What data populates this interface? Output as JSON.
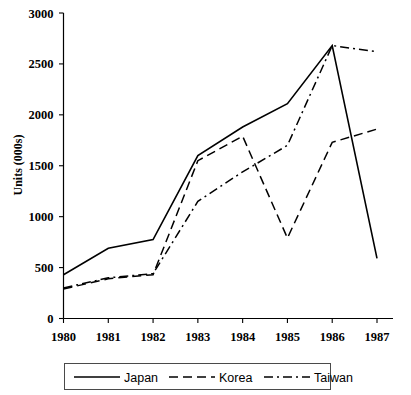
{
  "chart_data": {
    "type": "line",
    "title": "",
    "subtitle": "",
    "xlabel": "",
    "ylabel": "Units (000s)",
    "categories": [
      "1980",
      "1981",
      "1982",
      "1983",
      "1984",
      "1985",
      "1986",
      "1987"
    ],
    "x": [
      1980,
      1981,
      1982,
      1983,
      1984,
      1985,
      1986,
      1987
    ],
    "xlim": [
      1980,
      1987
    ],
    "ylim": [
      0,
      3000
    ],
    "y_ticks": [
      0,
      500,
      1000,
      1500,
      2000,
      2500,
      3000
    ],
    "y_tick_labels": [
      "0",
      "500",
      "1000",
      "1500",
      "2000",
      "2500",
      "3000"
    ],
    "grid": false,
    "legend_position": "bottom",
    "series": [
      {
        "name": "Japan",
        "line_style": "solid",
        "color": "#000000",
        "values": [
          430,
          690,
          775,
          1600,
          1880,
          2110,
          2680,
          590
        ]
      },
      {
        "name": "Korea",
        "line_style": "dashed",
        "color": "#000000",
        "values": [
          290,
          390,
          430,
          1550,
          1790,
          790,
          1730,
          1860
        ]
      },
      {
        "name": "Taiwan",
        "line_style": "dash-dot",
        "color": "#000000",
        "values": [
          300,
          400,
          440,
          1150,
          1440,
          1700,
          2680,
          2620
        ]
      }
    ]
  },
  "axis": {
    "y_title": "Units (000s)"
  },
  "legend": {
    "entries": [
      {
        "label": "Japan",
        "style": "solid"
      },
      {
        "label": "Korea",
        "style": "dashed"
      },
      {
        "label": "Taiwan",
        "style": "dash-dot"
      }
    ]
  }
}
